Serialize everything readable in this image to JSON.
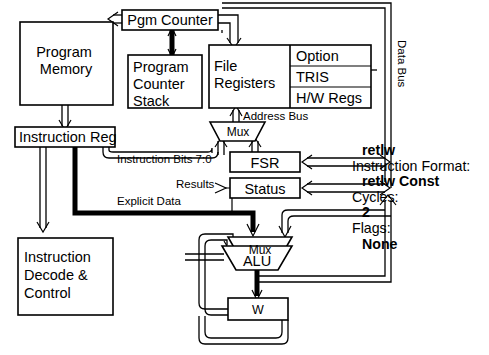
{
  "diagram": {
    "blocks": {
      "program_memory": "Program Memory",
      "pgm_counter": "Pgm Counter",
      "pc_stack": "Program Counter Stack",
      "file_registers": "File Registers",
      "option": "Option",
      "tris": "TRIS",
      "hw_regs": "H/W Regs",
      "instruction_reg": "Instruction Reg",
      "instruction_decode": "Instruction Decode & Control",
      "fsr": "FSR",
      "status": "Status",
      "alu": "ALU",
      "w": "W",
      "mux_address": "Mux",
      "mux_alu": "Mux"
    },
    "block_lines": {
      "program_memory": [
        "Program",
        "Memory"
      ],
      "pc_stack": [
        "Program",
        "Counter",
        "Stack"
      ],
      "file_registers": [
        "File",
        "Registers"
      ],
      "instruction_decode": [
        "Instruction",
        "Decode &",
        "Control"
      ]
    },
    "bus_labels": {
      "data_bus": "Data Bus",
      "address_bus": "Address Bus",
      "instruction_bits": "Instruction Bits 7:0",
      "results": "Results",
      "explicit_data": "Explicit Data"
    }
  },
  "info_panel": {
    "mnemonic": "retlw",
    "format_label": "Instruction Format:",
    "format_value": "retlw Const",
    "cycles_label": "Cycles:",
    "cycles_value": "2",
    "flags_label": "Flags:",
    "flags_value": "None"
  },
  "colors": {
    "ink": "#000000",
    "paper": "#ffffff"
  }
}
